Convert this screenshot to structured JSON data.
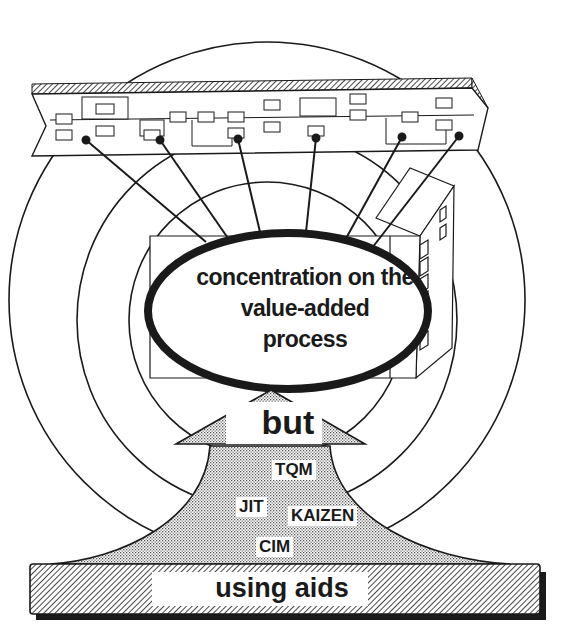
{
  "diagram": {
    "center_label": {
      "lines": [
        "concentration on the",
        "value-added",
        "process"
      ]
    },
    "arrow_label": "but",
    "aids": [
      {
        "label": "TQM"
      },
      {
        "label": "JIT"
      },
      {
        "label": "KAIZEN"
      },
      {
        "label": "CIM"
      }
    ],
    "base_label": "using aids",
    "elements": {
      "top_band": "process-chain-band",
      "building": "factory-building",
      "rings": 3
    },
    "colors": {
      "ink": "#1a1a1a",
      "background": "#ffffff",
      "stipple": "#bdbdbd"
    }
  }
}
